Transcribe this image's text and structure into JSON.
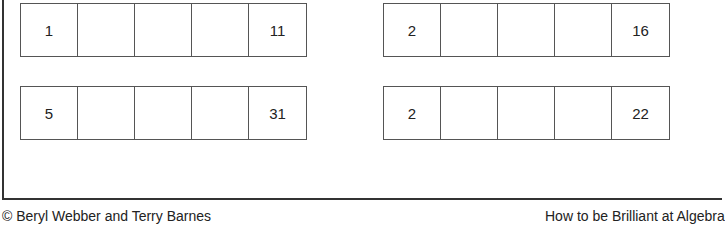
{
  "worksheet": {
    "sequences": [
      {
        "cells": [
          "1",
          "",
          "",
          "",
          "11"
        ]
      },
      {
        "cells": [
          "2",
          "",
          "",
          "",
          "16"
        ]
      },
      {
        "cells": [
          "5",
          "",
          "",
          "",
          "31"
        ]
      },
      {
        "cells": [
          "2",
          "",
          "",
          "",
          "22"
        ]
      }
    ]
  },
  "footer": {
    "copyright": "© Beryl Webber and Terry Barnes",
    "book_title": "How to be Brilliant at Algebra"
  }
}
